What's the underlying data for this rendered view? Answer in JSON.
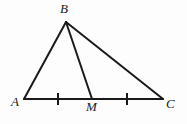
{
  "figure": {
    "name": "triangle-with-median",
    "background_color": "#fdfdfd",
    "stroke_color": "#1a1a1a",
    "stroke_width": 2,
    "labels": {
      "a": "A",
      "b": "B",
      "m": "M",
      "c": "C"
    },
    "points": {
      "A": {
        "x": 24,
        "y": 99
      },
      "B": {
        "x": 66,
        "y": 22
      },
      "M": {
        "x": 92,
        "y": 99
      },
      "C": {
        "x": 163,
        "y": 99
      }
    },
    "segments": [
      {
        "name": "segment-AB",
        "x1": 24,
        "y1": 99,
        "x2": 66,
        "y2": 22
      },
      {
        "name": "segment-BC",
        "x1": 66,
        "y1": 22,
        "x2": 163,
        "y2": 99
      },
      {
        "name": "segment-BM",
        "x1": 66,
        "y1": 22,
        "x2": 92,
        "y2": 99
      },
      {
        "name": "segment-AC",
        "x1": 24,
        "y1": 99,
        "x2": 163,
        "y2": 99
      }
    ],
    "tick_marks": [
      {
        "name": "tick-mark-AM",
        "x": 58,
        "y1": 93,
        "y2": 105
      },
      {
        "name": "tick-mark-MC",
        "x": 127,
        "y1": 93,
        "y2": 105
      }
    ]
  }
}
